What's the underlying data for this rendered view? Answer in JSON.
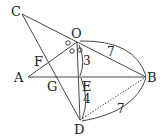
{
  "diagram": {
    "points": {
      "C": {
        "label": "C",
        "x": 22,
        "y": 14
      },
      "O": {
        "label": "O",
        "x": 77,
        "y": 42
      },
      "A": {
        "label": "A",
        "x": 28,
        "y": 77
      },
      "B": {
        "label": "B",
        "x": 146,
        "y": 77
      },
      "E": {
        "label": "E",
        "x": 79,
        "y": 77
      },
      "D": {
        "label": "D",
        "x": 80,
        "y": 120
      },
      "F": {
        "label": "F",
        "x": 48,
        "y": 62
      },
      "G": {
        "label": "G",
        "x": 56,
        "y": 77
      }
    },
    "measures": {
      "OB": "7",
      "OE": "3",
      "ED": "4",
      "DB": "7"
    },
    "segments": [
      [
        "C",
        "B"
      ],
      [
        "C",
        "D"
      ],
      [
        "A",
        "O"
      ],
      [
        "A",
        "B"
      ],
      [
        "O",
        "D"
      ],
      [
        "O",
        "B"
      ]
    ],
    "dashed_segments": [
      [
        "D",
        "B"
      ]
    ],
    "angle_marks": "equal angles marked with small circles at O"
  }
}
